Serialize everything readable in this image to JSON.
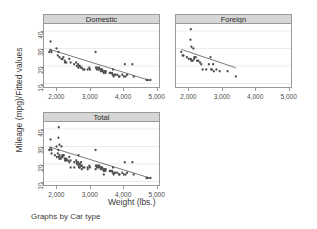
{
  "figure": {
    "ylabel": "Mileage (mpg)/Fitted values",
    "xlabel": "Weight (lbs.)",
    "caption": "Graphs by Car type",
    "panel_title_bg": "#d6d6d6",
    "marker_color": "#4d4d4d",
    "line_color": "#555555",
    "grid_color": "#e2e2e2",
    "axis_color": "#9a9a9a"
  },
  "chart_data": {
    "type": "scatter",
    "title": "",
    "subtitle": "",
    "xlabel": "Weight (lbs.)",
    "ylabel": "Mileage (mpg)/Fitted values",
    "caption": "Graphs by Car type",
    "grid": true,
    "grid_axis": "y",
    "legend": "none",
    "xlim": [
      1600,
      5100
    ],
    "ylim": [
      8,
      44
    ],
    "xticks": [
      2000,
      3000,
      4000,
      5000
    ],
    "xticklabels": [
      "2,000",
      "3,000",
      "4,000",
      "5,000"
    ],
    "yticks": [
      10,
      20,
      30,
      40
    ],
    "yticklabels": [
      "10",
      "20",
      "30",
      "40"
    ],
    "panels": [
      {
        "name": "Domestic",
        "row": 0,
        "col": 0,
        "fit": {
          "type": "linear-on-subset",
          "x1": 1760,
          "y1": 29.6,
          "x2": 4840,
          "y2": 11.6
        },
        "points": [
          [
            1800,
            34.0
          ],
          [
            1760,
            28.0
          ],
          [
            1800,
            29.0
          ],
          [
            1830,
            28.0
          ],
          [
            1980,
            30.0
          ],
          [
            2020,
            26.0
          ],
          [
            2040,
            28.0
          ],
          [
            2070,
            25.0
          ],
          [
            2130,
            24.0
          ],
          [
            2160,
            24.0
          ],
          [
            2190,
            25.0
          ],
          [
            2230,
            23.0
          ],
          [
            2240,
            22.0
          ],
          [
            2280,
            22.0
          ],
          [
            2370,
            24.0
          ],
          [
            2410,
            22.0
          ],
          [
            2520,
            21.0
          ],
          [
            2580,
            22.0
          ],
          [
            2600,
            20.0
          ],
          [
            2640,
            21.0
          ],
          [
            2650,
            19.0
          ],
          [
            2670,
            20.0
          ],
          [
            2690,
            20.0
          ],
          [
            2730,
            19.0
          ],
          [
            2750,
            19.0
          ],
          [
            2790,
            18.0
          ],
          [
            2830,
            18.0
          ],
          [
            2930,
            18.0
          ],
          [
            2980,
            19.0
          ],
          [
            3000,
            18.0
          ],
          [
            3170,
            28.0
          ],
          [
            3180,
            19.0
          ],
          [
            3200,
            19.0
          ],
          [
            3210,
            18.0
          ],
          [
            3250,
            19.0
          ],
          [
            3260,
            18.0
          ],
          [
            3280,
            19.0
          ],
          [
            3310,
            18.0
          ],
          [
            3330,
            17.0
          ],
          [
            3350,
            18.0
          ],
          [
            3370,
            18.0
          ],
          [
            3380,
            17.0
          ],
          [
            3420,
            16.0
          ],
          [
            3430,
            17.0
          ],
          [
            3470,
            16.0
          ],
          [
            3480,
            17.0
          ],
          [
            3600,
            16.0
          ],
          [
            3620,
            16.0
          ],
          [
            3670,
            16.0
          ],
          [
            3690,
            15.0
          ],
          [
            3700,
            18.0
          ],
          [
            3720,
            14.0
          ],
          [
            3740,
            15.0
          ],
          [
            3770,
            15.0
          ],
          [
            3830,
            15.0
          ],
          [
            3880,
            14.0
          ],
          [
            3900,
            14.0
          ],
          [
            3980,
            15.0
          ],
          [
            4030,
            14.0
          ],
          [
            4060,
            21.0
          ],
          [
            4080,
            14.0
          ],
          [
            4130,
            15.0
          ],
          [
            4290,
            21.0
          ],
          [
            4330,
            14.0
          ],
          [
            4720,
            12.0
          ],
          [
            4760,
            12.0
          ],
          [
            4840,
            12.0
          ]
        ]
      },
      {
        "name": "Foreign",
        "row": 0,
        "col": 1,
        "fit": {
          "type": "linear-on-subset",
          "x1": 1760,
          "y1": 29.5,
          "x2": 3420,
          "y2": 19.0
        },
        "points": [
          [
            2050,
            41.0
          ],
          [
            2040,
            35.0
          ],
          [
            2070,
            31.0
          ],
          [
            2130,
            30.0
          ],
          [
            1760,
            28.0
          ],
          [
            1800,
            26.0
          ],
          [
            1830,
            26.0
          ],
          [
            1930,
            25.0
          ],
          [
            1990,
            24.0
          ],
          [
            2050,
            24.0
          ],
          [
            2070,
            23.0
          ],
          [
            2110,
            23.0
          ],
          [
            2150,
            24.0
          ],
          [
            2160,
            25.0
          ],
          [
            2200,
            25.0
          ],
          [
            2240,
            23.0
          ],
          [
            2280,
            23.0
          ],
          [
            2330,
            22.0
          ],
          [
            2370,
            21.0
          ],
          [
            2410,
            18.0
          ],
          [
            2520,
            18.0
          ],
          [
            2600,
            21.0
          ],
          [
            2650,
            25.0
          ],
          [
            2670,
            18.0
          ],
          [
            2690,
            18.0
          ],
          [
            2730,
            21.0
          ],
          [
            2750,
            17.0
          ],
          [
            2830,
            18.0
          ],
          [
            2930,
            17.0
          ],
          [
            3170,
            17.0
          ],
          [
            3420,
            14.0
          ]
        ]
      },
      {
        "name": "Total",
        "row": 1,
        "col": 0,
        "fit": {
          "type": "linear-on-subset",
          "x1": 1760,
          "y1": 29.8,
          "x2": 4840,
          "y2": 11.9
        },
        "points": [
          [
            1800,
            34.0
          ],
          [
            2050,
            41.0
          ],
          [
            2040,
            35.0
          ],
          [
            1760,
            28.0
          ],
          [
            1800,
            29.0
          ],
          [
            1830,
            28.0
          ],
          [
            1830,
            26.0
          ],
          [
            1930,
            25.0
          ],
          [
            1980,
            30.0
          ],
          [
            1990,
            24.0
          ],
          [
            2020,
            26.0
          ],
          [
            2040,
            28.0
          ],
          [
            2050,
            24.0
          ],
          [
            2070,
            31.0
          ],
          [
            2070,
            25.0
          ],
          [
            2070,
            23.0
          ],
          [
            2110,
            23.0
          ],
          [
            2130,
            30.0
          ],
          [
            2130,
            24.0
          ],
          [
            2150,
            24.0
          ],
          [
            2160,
            24.0
          ],
          [
            2160,
            25.0
          ],
          [
            2190,
            25.0
          ],
          [
            2200,
            25.0
          ],
          [
            2230,
            23.0
          ],
          [
            2240,
            22.0
          ],
          [
            2240,
            23.0
          ],
          [
            2280,
            22.0
          ],
          [
            2280,
            23.0
          ],
          [
            2330,
            22.0
          ],
          [
            2370,
            24.0
          ],
          [
            2370,
            21.0
          ],
          [
            2410,
            22.0
          ],
          [
            2410,
            18.0
          ],
          [
            2520,
            21.0
          ],
          [
            2520,
            18.0
          ],
          [
            2580,
            22.0
          ],
          [
            2600,
            20.0
          ],
          [
            2600,
            21.0
          ],
          [
            2640,
            21.0
          ],
          [
            2650,
            19.0
          ],
          [
            2650,
            25.0
          ],
          [
            2670,
            20.0
          ],
          [
            2670,
            18.0
          ],
          [
            2690,
            20.0
          ],
          [
            2690,
            18.0
          ],
          [
            2730,
            19.0
          ],
          [
            2730,
            21.0
          ],
          [
            2750,
            19.0
          ],
          [
            2750,
            17.0
          ],
          [
            2790,
            18.0
          ],
          [
            2830,
            18.0
          ],
          [
            2930,
            18.0
          ],
          [
            2930,
            17.0
          ],
          [
            2980,
            19.0
          ],
          [
            3000,
            18.0
          ],
          [
            3170,
            28.0
          ],
          [
            3170,
            17.0
          ],
          [
            3180,
            19.0
          ],
          [
            3200,
            19.0
          ],
          [
            3210,
            18.0
          ],
          [
            3250,
            19.0
          ],
          [
            3260,
            18.0
          ],
          [
            3280,
            19.0
          ],
          [
            3310,
            18.0
          ],
          [
            3330,
            17.0
          ],
          [
            3350,
            18.0
          ],
          [
            3370,
            18.0
          ],
          [
            3380,
            17.0
          ],
          [
            3420,
            16.0
          ],
          [
            3420,
            14.0
          ],
          [
            3430,
            17.0
          ],
          [
            3470,
            16.0
          ],
          [
            3480,
            17.0
          ],
          [
            3600,
            16.0
          ],
          [
            3620,
            16.0
          ],
          [
            3670,
            16.0
          ],
          [
            3690,
            15.0
          ],
          [
            3700,
            18.0
          ],
          [
            3720,
            14.0
          ],
          [
            3740,
            15.0
          ],
          [
            3770,
            15.0
          ],
          [
            3830,
            15.0
          ],
          [
            3880,
            14.0
          ],
          [
            3900,
            14.0
          ],
          [
            3980,
            15.0
          ],
          [
            4030,
            14.0
          ],
          [
            4060,
            21.0
          ],
          [
            4080,
            14.0
          ],
          [
            4130,
            15.0
          ],
          [
            4290,
            21.0
          ],
          [
            4330,
            14.0
          ],
          [
            4720,
            12.0
          ],
          [
            4760,
            12.0
          ],
          [
            4840,
            12.0
          ]
        ]
      }
    ]
  }
}
